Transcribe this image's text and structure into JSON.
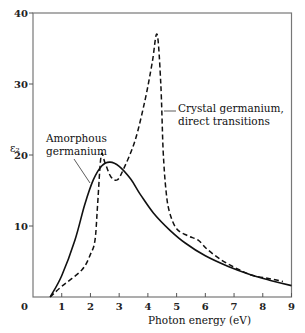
{
  "chart_data": {
    "type": "line",
    "title": "",
    "xlabel": "Photon energy (eV)",
    "ylabel": "ε₂",
    "xlim": [
      0,
      9
    ],
    "ylim": [
      0,
      40
    ],
    "x_ticks": [
      1,
      2,
      3,
      4,
      5,
      6,
      7,
      8,
      9
    ],
    "y_ticks": [
      10,
      20,
      30,
      40
    ],
    "origin_label": "0",
    "grid": false,
    "legend": "none (inline annotations)",
    "series": [
      {
        "name": "Amorphous germanium",
        "style": "solid",
        "x": [
          0.6,
          1.0,
          1.46,
          1.8,
          2.1,
          2.4,
          2.68,
          3.0,
          3.4,
          3.73,
          4.2,
          4.77,
          5.3,
          6.0,
          6.8,
          7.6,
          8.3,
          9.0
        ],
        "y": [
          0.0,
          3.0,
          8.0,
          13.0,
          16.5,
          18.5,
          19.0,
          18.4,
          16.6,
          14.5,
          11.8,
          9.4,
          7.6,
          5.8,
          4.3,
          3.1,
          2.3,
          1.6
        ]
      },
      {
        "name": "Crystal germanium, direct transitions",
        "style": "dashed",
        "x": [
          0.6,
          1.0,
          1.7,
          2.0,
          2.16,
          2.25,
          2.37,
          2.5,
          2.7,
          2.93,
          3.15,
          3.55,
          3.9,
          4.15,
          4.32,
          4.45,
          4.53,
          4.63,
          4.75,
          5.0,
          5.4,
          5.75,
          6.1,
          6.6,
          7.1,
          7.6,
          8.2,
          8.7
        ],
        "y": [
          0.0,
          1.5,
          3.8,
          6.0,
          8.0,
          13.0,
          19.9,
          19.0,
          17.0,
          16.5,
          18.0,
          22.0,
          27.7,
          33.0,
          37.0,
          30.0,
          20.7,
          15.0,
          12.0,
          9.6,
          8.6,
          8.0,
          6.6,
          5.1,
          4.0,
          3.1,
          2.6,
          2.2
        ]
      }
    ],
    "annotations": [
      {
        "text_lines": [
          "Amorphous",
          "germanium"
        ],
        "points_to": "Amorphous germanium",
        "at_x": 1.7,
        "at_y": 17
      },
      {
        "text_lines": [
          "Crystal germanium,",
          "direct transitions"
        ],
        "points_to": "Crystal germanium, direct transitions",
        "at_x": 4.55,
        "at_y": 26
      }
    ]
  },
  "labels": {
    "ylabel": "ε₂",
    "xlabel": "Photon energy (eV)",
    "origin": "0",
    "amorphous_1": "Amorphous",
    "amorphous_2": "germanium",
    "crystal_1": "Crystal germanium,",
    "crystal_2": "direct transitions"
  }
}
